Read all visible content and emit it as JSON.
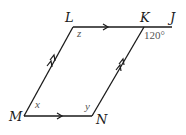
{
  "diagram": {
    "type": "parallelogram",
    "colors": {
      "line": "#1a1a1a",
      "angle_text": "#555555"
    },
    "vertices": {
      "L": "L",
      "K": "K",
      "J": "J",
      "M": "M",
      "N": "N"
    },
    "angles": {
      "z": "z",
      "x": "x",
      "y": "y",
      "exterior_at_K": "120°"
    },
    "parallel_marks": {
      "LK_MN": "single arrow",
      "LM_KN": "double arrow"
    }
  }
}
